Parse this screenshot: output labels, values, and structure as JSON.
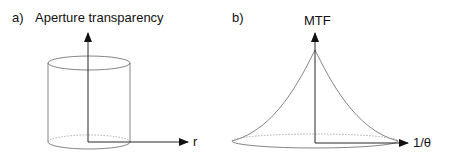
{
  "panel_a": {
    "label": "a)",
    "title": "Aperture transparency",
    "x_axis_label": "r"
  },
  "panel_b": {
    "label": "b)",
    "title": "MTF",
    "x_axis_label": "1/θ"
  }
}
